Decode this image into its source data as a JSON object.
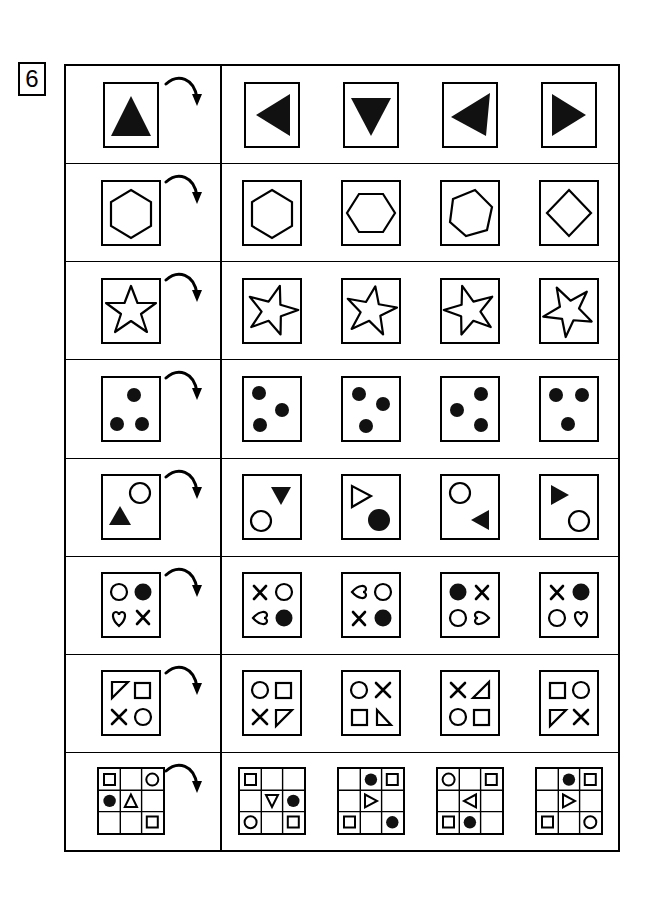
{
  "question": {
    "number": "6",
    "type": "rotation-matrix-puzzle",
    "rows_count": 8,
    "options_per_row": 4
  },
  "icons": {
    "rotation_arrow": "curved-rotation-arrow-icon"
  },
  "colors": {
    "ink": "#000000",
    "paper": "#ffffff",
    "fill": "#111111"
  },
  "rows": [
    {
      "id": "row-1",
      "name": "filled-triangle-row",
      "question": {
        "figure": "triangle-up-filled"
      },
      "options": [
        {
          "label": "A",
          "figure": "triangle-left-filled"
        },
        {
          "label": "B",
          "figure": "triangle-down-filled"
        },
        {
          "label": "C",
          "figure": "triangle-left-tilted-filled"
        },
        {
          "label": "D",
          "figure": "triangle-right-filled"
        }
      ]
    },
    {
      "id": "row-2",
      "name": "hexagon-row",
      "question": {
        "figure": "hexagon-outline-0deg"
      },
      "options": [
        {
          "label": "A",
          "figure": "hexagon-outline-0deg"
        },
        {
          "label": "B",
          "figure": "hexagon-outline-90deg"
        },
        {
          "label": "C",
          "figure": "hexagon-outline-25deg"
        },
        {
          "label": "D",
          "figure": "diamond-outline"
        }
      ]
    },
    {
      "id": "row-3",
      "name": "star-row",
      "question": {
        "figure": "star-outline-0deg"
      },
      "options": [
        {
          "label": "A",
          "figure": "star-outline-160deg"
        },
        {
          "label": "B",
          "figure": "star-outline-10deg"
        },
        {
          "label": "C",
          "figure": "star-outline-200deg"
        },
        {
          "label": "D",
          "figure": "star-outline-115deg"
        }
      ]
    },
    {
      "id": "row-4",
      "name": "three-dots-row",
      "question": {
        "figure": "dots-top-right-bottomleft-bottomright"
      },
      "options": [
        {
          "label": "A",
          "figure": "dots-topleft-mid-bottomleft"
        },
        {
          "label": "B",
          "figure": "dots-topleft-midright-bottom"
        },
        {
          "label": "C",
          "figure": "dots-topright-midleft-bottomright"
        },
        {
          "label": "D",
          "figure": "dots-topleft-topright-bottom"
        }
      ]
    },
    {
      "id": "row-5",
      "name": "triangle-circle-pair-row",
      "question": {
        "figure": "circle-topright-triangleup-bottomleft"
      },
      "options": [
        {
          "label": "A",
          "figure": "triangledown-topright-circle-bottomleft"
        },
        {
          "label": "B",
          "figure": "triangleright-open-topleft-filledcircle-bottomright"
        },
        {
          "label": "C",
          "figure": "circle-topleft-triangleleft-bottomright"
        },
        {
          "label": "D",
          "figure": "triangleright-topleft-circle-bottomright"
        }
      ]
    },
    {
      "id": "row-6",
      "name": "quad-symbol-row",
      "question": {
        "figure": "grid2x2",
        "cells": [
          "circle-open",
          "circle-filled",
          "heart-up",
          "cross"
        ]
      },
      "options": [
        {
          "label": "A",
          "figure": "grid2x2",
          "cells": [
            "cross",
            "circle-open",
            "heart-left",
            "circle-filled"
          ]
        },
        {
          "label": "B",
          "figure": "grid2x2",
          "cells": [
            "heart-left",
            "circle-open",
            "cross",
            "circle-filled"
          ]
        },
        {
          "label": "C",
          "figure": "grid2x2",
          "cells": [
            "circle-filled",
            "cross",
            "circle-open",
            "heart-right"
          ]
        },
        {
          "label": "D",
          "figure": "grid2x2",
          "cells": [
            "cross",
            "circle-filled",
            "circle-open",
            "heart-up"
          ]
        }
      ]
    },
    {
      "id": "row-7",
      "name": "quad-shape-row",
      "question": {
        "figure": "grid2x2",
        "cells": [
          "righttriangle-tl",
          "square",
          "cross",
          "circle-open"
        ]
      },
      "options": [
        {
          "label": "A",
          "figure": "grid2x2",
          "cells": [
            "circle-open",
            "square",
            "cross",
            "righttriangle-tr"
          ]
        },
        {
          "label": "B",
          "figure": "grid2x2",
          "cells": [
            "circle-open",
            "cross",
            "square",
            "righttriangle-br"
          ]
        },
        {
          "label": "C",
          "figure": "grid2x2",
          "cells": [
            "cross",
            "righttriangle-bl",
            "circle-open",
            "square"
          ]
        },
        {
          "label": "D",
          "figure": "grid2x2",
          "cells": [
            "square",
            "circle-open",
            "righttriangle-tr",
            "cross"
          ]
        }
      ]
    },
    {
      "id": "row-8",
      "name": "nine-grid-row",
      "question": {
        "figure": "grid3x3",
        "cells": [
          "square",
          "",
          "circle-open",
          "circle-filled",
          "triangle-up",
          "",
          "",
          "",
          "square"
        ]
      },
      "options": [
        {
          "label": "A",
          "figure": "grid3x3",
          "cells": [
            "square",
            "",
            "",
            "",
            "triangle-down",
            "circle-filled",
            "circle-open",
            "",
            "square"
          ]
        },
        {
          "label": "B",
          "figure": "grid3x3",
          "cells": [
            "",
            "circle-filled",
            "square",
            "",
            "triangle-right",
            "",
            "square",
            "",
            "circle-filled"
          ]
        },
        {
          "label": "C",
          "figure": "grid3x3",
          "cells": [
            "circle-open",
            "",
            "square",
            "",
            "triangle-left",
            "",
            "square",
            "circle-filled",
            ""
          ]
        },
        {
          "label": "D",
          "figure": "grid3x3",
          "cells": [
            "",
            "circle-filled",
            "square",
            "",
            "triangle-right",
            "",
            "square",
            "",
            "circle-open"
          ]
        }
      ]
    }
  ]
}
